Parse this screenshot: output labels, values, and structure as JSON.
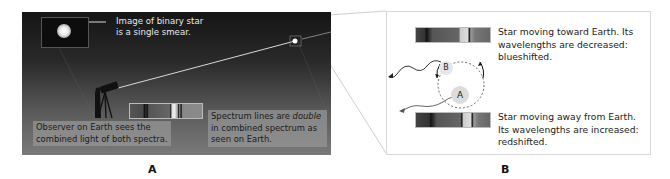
{
  "panel_a": {
    "inset_caption_line1": "Image of binary star",
    "inset_caption_line2": "is a single smear.",
    "observer_caption_line1": "Observer on Earth sees the",
    "observer_caption_line2": "combined light of both spectra.",
    "spectrum_caption_line1": "Spectrum lines are ",
    "spectrum_caption_emph": "double",
    "spectrum_caption_line2": "in combined spectrum as",
    "spectrum_caption_line3": "seen on Earth.",
    "label": "A"
  },
  "panel_b": {
    "blueshift_text_line1": "Star moving toward Earth. Its",
    "blueshift_text_line2": "wavelengths are decreased:",
    "blueshift_text_line3": "blueshifted.",
    "redshift_text_line1": "Star moving away from Earth.",
    "redshift_text_line2": "Its wavelengths are increased:",
    "redshift_text_line3": "redshifted.",
    "star_b_label": "B",
    "star_a_label": "A",
    "label": "B"
  },
  "colors": {
    "sky_top": "#151515",
    "sky_bottom": "#7a7a7a",
    "caption_box": "#969696",
    "panel_border": "#d8d8d8"
  }
}
